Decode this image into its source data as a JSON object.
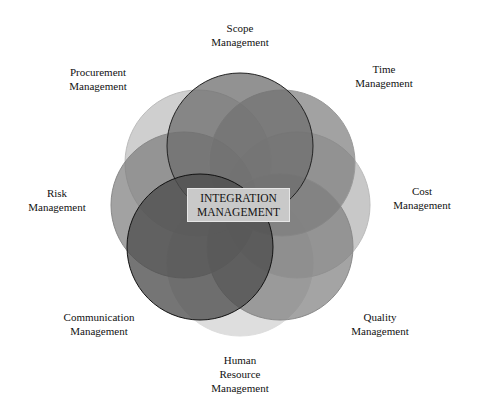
{
  "center": {
    "line1": "INTEGRATION",
    "line2": "MANAGEMENT"
  },
  "areas": [
    {
      "id": "scope",
      "line1": "Scope",
      "line2": "Management",
      "line3": "",
      "cx": 240,
      "cy": 146,
      "fill": "#6e6e6e",
      "opacity": 0.75,
      "stroke": "#222"
    },
    {
      "id": "time",
      "line1": "Time",
      "line2": "Management",
      "line3": "",
      "cx": 282,
      "cy": 163,
      "fill": "#7a7a7a",
      "opacity": 0.7,
      "stroke": "#999"
    },
    {
      "id": "cost",
      "line1": "Cost",
      "line2": "Management",
      "line3": "",
      "cx": 297,
      "cy": 205,
      "fill": "#9a9a9a",
      "opacity": 0.55,
      "stroke": "#bbb"
    },
    {
      "id": "quality",
      "line1": "Quality",
      "line2": "Management",
      "line3": "",
      "cx": 280,
      "cy": 247,
      "fill": "#7e7e7e",
      "opacity": 0.7,
      "stroke": "#888"
    },
    {
      "id": "human-resource",
      "line1": "Human",
      "line2": "Resource",
      "line3": "Management",
      "cx": 240,
      "cy": 263,
      "fill": "#bdbdbd",
      "opacity": 0.5,
      "stroke": "#ddd"
    },
    {
      "id": "communication",
      "line1": "Communication",
      "line2": "Management",
      "line3": "",
      "cx": 200,
      "cy": 247,
      "fill": "#4e4e4e",
      "opacity": 0.78,
      "stroke": "#111"
    },
    {
      "id": "risk",
      "line1": "Risk",
      "line2": "Management",
      "line3": "",
      "cx": 184,
      "cy": 205,
      "fill": "#7a7a7a",
      "opacity": 0.7,
      "stroke": "#888"
    },
    {
      "id": "procurement",
      "line1": "Procurement",
      "line2": "Management",
      "line3": "",
      "cx": 198,
      "cy": 163,
      "fill": "#a8a8a8",
      "opacity": 0.55,
      "stroke": "#bbb"
    }
  ],
  "labels": {
    "scope": {
      "x": 240,
      "y": 21
    },
    "time": {
      "x": 384,
      "y": 62
    },
    "cost": {
      "x": 422,
      "y": 184
    },
    "quality": {
      "x": 380,
      "y": 310
    },
    "human-resource": {
      "x": 240,
      "y": 353
    },
    "communication": {
      "x": 99,
      "y": 310
    },
    "risk": {
      "x": 57,
      "y": 186
    },
    "procurement": {
      "x": 98,
      "y": 65
    }
  },
  "circle_radius": 73
}
